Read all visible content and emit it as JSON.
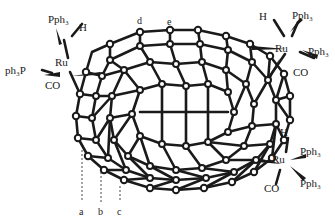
{
  "diagram": {
    "title": "",
    "cage_description": "Fullerene cage bearing three ruthenium complexes",
    "ink_color": "#1a1a1a",
    "background": "#ffffff",
    "complexes": [
      {
        "id": "complex-top-left",
        "metal": "Ru",
        "ligands": {
          "top": "Pph₃",
          "top_right": "H",
          "left": "ph₃P",
          "bottom": "CO"
        }
      },
      {
        "id": "complex-top-right",
        "metal": "Ru",
        "ligands": {
          "top_left": "H",
          "top_right": "Pph₃",
          "right": "Pph₃",
          "bottom": "CO"
        }
      },
      {
        "id": "complex-bottom-right",
        "metal": "Ru",
        "ligands": {
          "top": "H",
          "right": "Pph₃",
          "bottom_right": "Pph₃",
          "bottom": "CO"
        }
      }
    ],
    "bond_labels": {
      "a": "a",
      "b": "b",
      "c": "c",
      "d": "d",
      "e": "e"
    }
  }
}
